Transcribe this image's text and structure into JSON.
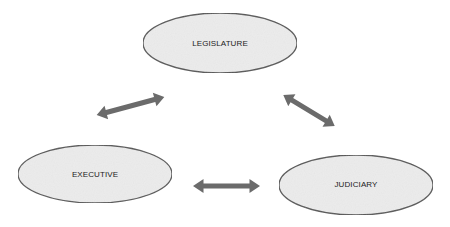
{
  "diagram": {
    "nodes": [
      {
        "id": "legislature",
        "label": "LEGISLATURE",
        "cx": 220,
        "cy": 43,
        "rx": 77,
        "ry": 30
      },
      {
        "id": "executive",
        "label": "EXECUTIVE",
        "cx": 95,
        "cy": 174,
        "rx": 77,
        "ry": 29
      },
      {
        "id": "judiciary",
        "label": "JUDICIARY",
        "cx": 356,
        "cy": 185,
        "rx": 77,
        "ry": 30
      }
    ],
    "edges": [
      {
        "from": "legislature",
        "to": "executive",
        "type": "bidirectional"
      },
      {
        "from": "legislature",
        "to": "judiciary",
        "type": "bidirectional"
      },
      {
        "from": "executive",
        "to": "judiciary",
        "type": "bidirectional"
      }
    ],
    "colors": {
      "node_fill": "#ececec",
      "node_stroke": "#555555",
      "arrow": "#6b6b6b"
    }
  }
}
